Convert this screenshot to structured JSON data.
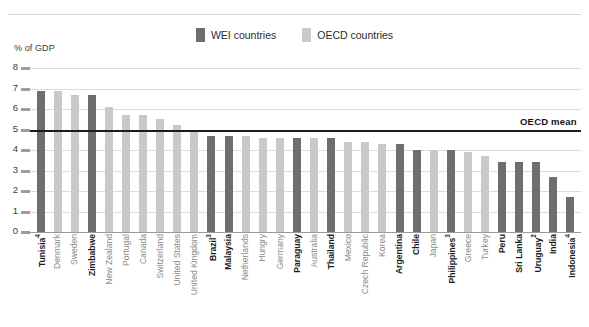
{
  "axis_title": "% of GDP",
  "legend": [
    {
      "label": "WEI countries",
      "color": "#6e6e6e",
      "key": "wei"
    },
    {
      "label": "OECD countries",
      "color": "#c9c9c9",
      "key": "oecd"
    }
  ],
  "mean_label": "OECD mean",
  "colors": {
    "wei": "#6e6e6e",
    "oecd": "#c9c9c9",
    "gridline": "#dcdcdc",
    "mean_line": "#1c1c1c",
    "wei_text": "#1c1c1c",
    "oecd_text": "#8a8a8a"
  },
  "chart_data": {
    "type": "bar",
    "title": "",
    "xlabel": "",
    "ylabel": "% of GDP",
    "ylim": [
      0,
      8
    ],
    "yticks": [
      0,
      1,
      2,
      3,
      4,
      5,
      6,
      7,
      8
    ],
    "grid": true,
    "legend_position": "top-center",
    "annotations": [
      {
        "text": "OECD mean",
        "type": "hline",
        "value": 5.0
      }
    ],
    "categories": [
      "Tunisia",
      "Denmark",
      "Sweden",
      "Zimbabwe",
      "New Zealand",
      "Portugal",
      "Canada",
      "Switzerland",
      "United States",
      "United Kingdom",
      "Brazil",
      "Malaysia",
      "Netherlands",
      "Hungry",
      "Germany",
      "Paraguay",
      "Australia",
      "Thailand",
      "Mexico",
      "Czech Republic",
      "Korea",
      "Argentina",
      "Chile",
      "Japan",
      "Philippines",
      "Greece",
      "Turkey",
      "Peru",
      "Sri Lanka",
      "Uruguay",
      "India",
      "Indonesia"
    ],
    "values": [
      6.9,
      6.9,
      6.7,
      6.7,
      6.1,
      5.7,
      5.7,
      5.5,
      5.2,
      4.9,
      4.7,
      4.7,
      4.7,
      4.6,
      4.6,
      4.6,
      4.6,
      4.6,
      4.4,
      4.4,
      4.3,
      4.3,
      4.0,
      4.0,
      4.0,
      3.9,
      3.7,
      3.4,
      3.4,
      3.4,
      2.7,
      1.7
    ],
    "groups": [
      "wei",
      "oecd",
      "oecd",
      "wei",
      "oecd",
      "oecd",
      "oecd",
      "oecd",
      "oecd",
      "oecd",
      "wei",
      "wei",
      "oecd",
      "oecd",
      "oecd",
      "wei",
      "oecd",
      "wei",
      "oecd",
      "oecd",
      "oecd",
      "wei",
      "wei",
      "oecd",
      "wei",
      "oecd",
      "oecd",
      "wei",
      "wei",
      "wei",
      "wei",
      "wei"
    ],
    "footnotes": [
      "Tunisia4",
      "Zimbabwe",
      "Brazil3",
      "Paraguay",
      "Thailand",
      "Philippines3",
      "Uruguay2",
      "Indonesia4"
    ],
    "superscripts": {
      "Tunisia": "4",
      "Brazil": "3",
      "Philippines": "3",
      "Uruguay": "2",
      "Indonesia": "4"
    },
    "series": [
      {
        "name": "WEI countries",
        "color": "#6e6e6e"
      },
      {
        "name": "OECD countries",
        "color": "#c9c9c9"
      }
    ]
  }
}
